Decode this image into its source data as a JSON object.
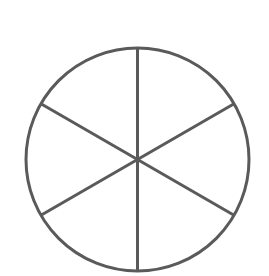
{
  "diagram": {
    "type": "circle-divided-into-sectors",
    "sectors": 6,
    "center": {
      "x": 137.5,
      "y": 159.5
    },
    "radius": 111.5,
    "start_angle_deg": -90,
    "stroke_color": "#5a5a5a",
    "stroke_width": 3,
    "fill_color": "#ffffff",
    "background": "#ffffff"
  }
}
